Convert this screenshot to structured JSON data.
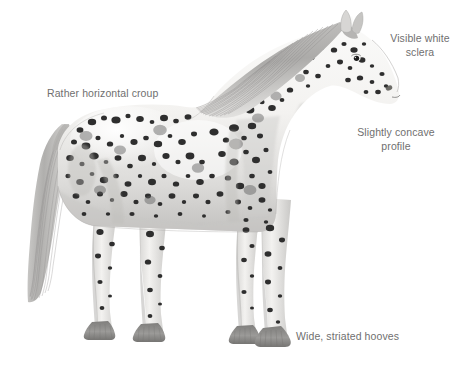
{
  "figure": {
    "view": "left side profile, standing",
    "background_color": "#ffffff",
    "label_color": "#6f6f6f",
    "coat": {
      "base_color": "#f2f1ef",
      "shadow_color": "#b9b8b6",
      "spot_color": "#2d2d2d",
      "mane_color": "#a9a8a6",
      "tail_color": "#b4b3b1",
      "hoof_color": "#8d8c8a"
    }
  },
  "annotations": [
    {
      "id": "visible-white-sclera",
      "text": "Visible white\nsclera",
      "points_to": "eye"
    },
    {
      "id": "slightly-concave-profile",
      "text": "Slightly concave\nprofile",
      "points_to": "head-profile"
    },
    {
      "id": "rather-horizontal-croup",
      "text": "Rather horizontal croup",
      "points_to": "croup"
    },
    {
      "id": "wide-striated-hooves",
      "text": "Wide, striated hooves",
      "points_to": "hoof"
    }
  ]
}
